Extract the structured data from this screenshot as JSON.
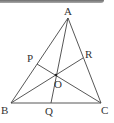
{
  "figure": {
    "type": "triangle-cevians",
    "points": {
      "A": {
        "label": "A",
        "x": 68,
        "y": 18
      },
      "B": {
        "label": "B",
        "x": 11,
        "y": 103
      },
      "C": {
        "label": "C",
        "x": 101,
        "y": 103
      },
      "P": {
        "label": "P",
        "x": 37,
        "y": 64
      },
      "Q": {
        "label": "Q",
        "x": 51,
        "y": 103
      },
      "R": {
        "label": "R",
        "x": 83,
        "y": 58
      },
      "O": {
        "label": "O",
        "x": 56,
        "y": 75
      }
    },
    "segments": [
      "AB",
      "BC",
      "CA",
      "AQ",
      "BR",
      "CP"
    ],
    "line_color": "#444444"
  }
}
